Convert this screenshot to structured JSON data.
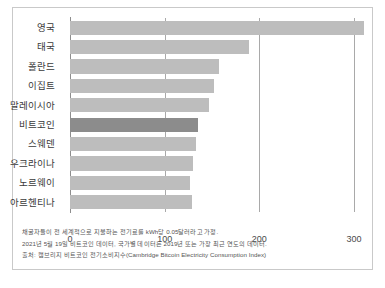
{
  "chart_data": {
    "type": "bar",
    "orientation": "horizontal",
    "title": "",
    "xlabel": "",
    "ylabel": "",
    "categories": [
      "영국",
      "태국",
      "폴란드",
      "이집트",
      "말레이시아",
      "비트코인",
      "스웨덴",
      "우크라이나",
      "노르웨이",
      "아르헨티나"
    ],
    "values": [
      310,
      189,
      157,
      152,
      147,
      135,
      133,
      130,
      127,
      129
    ],
    "highlight_category": "비트코인",
    "xlim": [
      0,
      320
    ],
    "xticks": [
      0,
      100,
      200,
      300
    ],
    "xtick_labels": [
      "0",
      "100",
      "200",
      "300"
    ],
    "grid": true,
    "grid_axis": "x",
    "legend": false,
    "bar_color": "#bdbdbd",
    "highlight_color": "#8c8c8c",
    "gridline_color": "#9a9a9a",
    "axis_color": "#8e8e8e",
    "frame_color": "#c9c9c9",
    "background_color": "#ffffff"
  },
  "footnotes": {
    "line1": "채굴자들이 전 세계적으로 지불하는 전기료를 kWh당 0.05달러라고 가정.",
    "line2": "2021년 5월 19일 비트코인 데이터, 국가별 데이터는 2019년 또는 가장 최근 연도의 데이터.",
    "line3": "출처: 캠브리지 비트코인 전기소비지수(Cambridge Bitcoin Electricity Consumption Index)"
  }
}
